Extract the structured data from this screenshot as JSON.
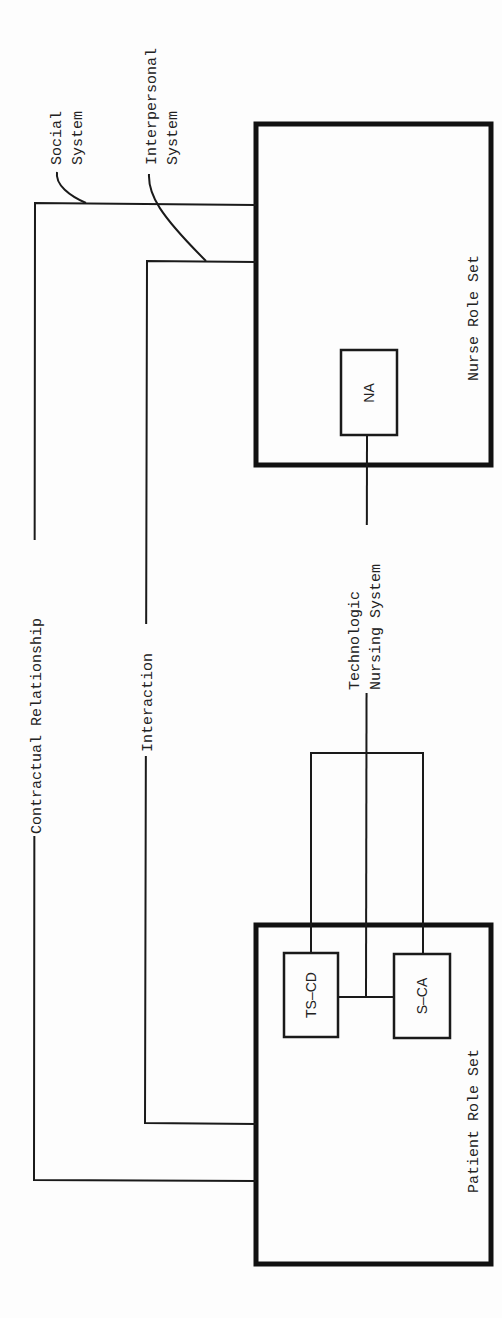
{
  "diagram": {
    "orientation": "rotated -90deg (reads bottom-to-top)",
    "labels": {
      "social_system_line1": "Social",
      "social_system_line2": "System",
      "interpersonal_system_line1": "Interpersonal",
      "interpersonal_system_line2": "System",
      "contractual_relationship": "Contractual Relationship",
      "interaction": "Interaction",
      "technologic_line1": "Technologic",
      "technologic_line2": "Nursing System"
    },
    "nodes": {
      "nurse_role_set": "Nurse Role Set",
      "patient_role_set": "Patient Role Set",
      "na": "NA",
      "ts_cd": "TS–CD",
      "s_ca": "S–CA"
    },
    "connections": [
      {
        "from": "Patient Role Set",
        "to": "Nurse Role Set",
        "label": "Contractual Relationship",
        "system": "Social System"
      },
      {
        "from": "Patient Role Set",
        "to": "Nurse Role Set",
        "label": "Interaction",
        "system": "Interpersonal System"
      },
      {
        "from": "TS–CD / S–CA",
        "to": "NA",
        "label": "Technologic Nursing System"
      }
    ],
    "colors": {
      "line": "#1a1a1a",
      "background": "#fdfdfd"
    }
  }
}
